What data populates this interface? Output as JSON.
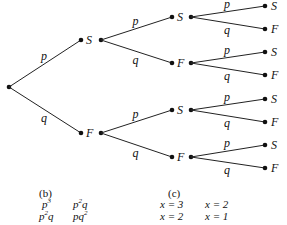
{
  "diagram": {
    "type": "probability-tree",
    "root": {
      "x": 9,
      "y": 87
    },
    "branch_labels": {
      "success": "p",
      "failure": "q"
    },
    "level1": [
      {
        "label": "S",
        "dot_in": [
          81,
          40
        ],
        "dot_out": [
          101,
          40
        ]
      },
      {
        "label": "F",
        "dot_in": [
          81,
          133
        ],
        "dot_out": [
          101,
          133
        ]
      }
    ],
    "level2": [
      {
        "label": "S",
        "parent": 0,
        "dot_in": [
          172,
          17
        ],
        "dot_out": [
          191,
          17
        ]
      },
      {
        "label": "F",
        "parent": 0,
        "dot_in": [
          172,
          63
        ],
        "dot_out": [
          191,
          63
        ]
      },
      {
        "label": "S",
        "parent": 1,
        "dot_in": [
          172,
          110
        ],
        "dot_out": [
          191,
          110
        ]
      },
      {
        "label": "F",
        "parent": 1,
        "dot_in": [
          172,
          157
        ],
        "dot_out": [
          191,
          157
        ]
      }
    ],
    "level3": [
      {
        "label": "S",
        "parent": 0,
        "dot": [
          265,
          6
        ]
      },
      {
        "label": "F",
        "parent": 0,
        "dot": [
          265,
          29
        ]
      },
      {
        "label": "S",
        "parent": 1,
        "dot": [
          265,
          52
        ]
      },
      {
        "label": "F",
        "parent": 1,
        "dot": [
          265,
          75
        ]
      },
      {
        "label": "S",
        "parent": 2,
        "dot": [
          265,
          99
        ]
      },
      {
        "label": "F",
        "parent": 2,
        "dot": [
          265,
          122
        ]
      },
      {
        "label": "S",
        "parent": 3,
        "dot": [
          265,
          145
        ]
      },
      {
        "label": "F",
        "parent": 3,
        "dot": [
          265,
          168
        ]
      }
    ]
  },
  "panel_b": {
    "caption": "(b)",
    "rows": [
      [
        {
          "base": "p",
          "exp": "3",
          "tail": ""
        },
        {
          "base": "p",
          "exp": "2",
          "tail": "q"
        }
      ],
      [
        {
          "base": "p",
          "exp": "2",
          "tail": "q"
        },
        {
          "base": "pq",
          "exp": "2",
          "tail": ""
        }
      ]
    ]
  },
  "panel_c": {
    "caption": "(c)",
    "rows": [
      [
        "x = 3",
        "x = 2"
      ],
      [
        "x = 2",
        "x = 1"
      ]
    ]
  }
}
